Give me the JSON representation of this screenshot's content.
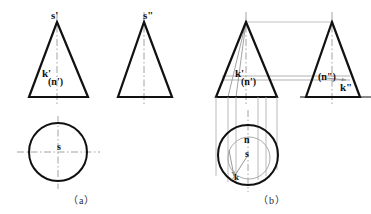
{
  "figure": {
    "background_color": "#ffffff",
    "outline_color": "#111111",
    "construction_color": "#9a9a9a",
    "centerline_color": "#8c8c8c",
    "width": 371,
    "height": 214
  },
  "captions": [
    {
      "id": "caption-a",
      "text": "（a）",
      "x": 68,
      "y": 192
    },
    {
      "id": "caption-b",
      "text": "（b）",
      "x": 258,
      "y": 192
    }
  ],
  "part_a": {
    "name": "a",
    "front_view": {
      "label_apex": "s'",
      "label_k": "k'",
      "label_n": "(n')",
      "apex": {
        "x": 57,
        "y": 22
      },
      "base_left": {
        "x": 29,
        "y": 97
      },
      "base_right": {
        "x": 88,
        "y": 97
      }
    },
    "side_view": {
      "label_apex": "s\"",
      "apex": {
        "x": 144,
        "y": 22
      },
      "base_left": {
        "x": 118,
        "y": 97
      },
      "base_right": {
        "x": 172,
        "y": 97
      }
    },
    "top_view": {
      "label_center": "s",
      "center": {
        "x": 58,
        "y": 152
      },
      "radius": 29
    }
  },
  "part_b": {
    "name": "b",
    "front_view": {
      "label_k": "k'",
      "label_n": "(n')",
      "apex": {
        "x": 246,
        "y": 22
      },
      "base_left": {
        "x": 216,
        "y": 97
      },
      "base_right": {
        "x": 277,
        "y": 97
      }
    },
    "side_view": {
      "label_n": "(n\")",
      "label_k": "k\"",
      "apex": {
        "x": 332,
        "y": 22
      },
      "base_left": {
        "x": 306,
        "y": 97
      },
      "base_right": {
        "x": 360,
        "y": 97
      }
    },
    "top_view": {
      "label_n": "n",
      "label_s": "s",
      "label_k": "k",
      "center": {
        "x": 248,
        "y": 155
      },
      "radius": 30
    }
  },
  "labels": {
    "a_front_apex": "s'",
    "a_front_k": "k'",
    "a_front_n": "(n')",
    "a_side_apex": "s\"",
    "a_top_s": "s",
    "b_front_k": "k'",
    "b_front_n": "(n')",
    "b_side_n": "(n\")",
    "b_side_k": "k\"",
    "b_top_n": "n",
    "b_top_s": "s",
    "b_top_k": "k"
  }
}
